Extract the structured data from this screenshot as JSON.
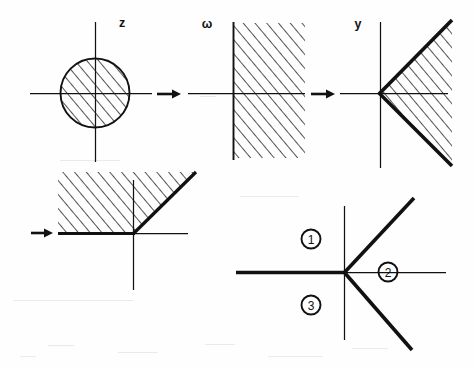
{
  "figure": {
    "background_color": "#fefefe",
    "ink_color": "#111111",
    "width": 474,
    "height": 368
  },
  "panels": [
    {
      "id": "panel-z",
      "label": "z",
      "label_pos": {
        "x": 122,
        "y": 27
      },
      "region_kind": "hatched-disk",
      "origin": {
        "x": 95,
        "y": 93
      },
      "radius": 35,
      "axes": {
        "x_from": 30,
        "x_to": 152,
        "y_from": 22,
        "y_to": 162
      },
      "hatch_angle_deg": 40,
      "hatch_spacing": 9
    },
    {
      "id": "panel-omega",
      "label": "ω",
      "label_pos": {
        "x": 207,
        "y": 27
      },
      "region_kind": "hatched-right-half-plane",
      "origin": {
        "x": 233,
        "y": 93
      },
      "axes": {
        "x_from": 188,
        "x_to": 305,
        "y_from": 22,
        "y_to": 160
      },
      "hatch_angle_deg": 40,
      "hatch_spacing": 9
    },
    {
      "id": "panel-y",
      "label": "y",
      "label_pos": {
        "x": 358,
        "y": 27
      },
      "region_kind": "hatched-wedge-right",
      "origin": {
        "x": 380,
        "y": 93
      },
      "axes": {
        "x_from": 340,
        "x_to": 448,
        "y_from": 22,
        "y_to": 168
      },
      "wedge_upper_angle_deg": -45,
      "wedge_lower_angle_deg": 45,
      "hatch_angle_deg": 40,
      "hatch_spacing": 9
    },
    {
      "id": "panel-bottom-left",
      "label": "",
      "region_kind": "hatched-above-bent-ray",
      "origin": {
        "x": 133,
        "y": 234
      },
      "axes": {
        "x_from": 60,
        "x_to": 188,
        "y_from": 180,
        "y_to": 290
      },
      "bend_angle_deg": 45,
      "hatch_angle_deg": 40,
      "hatch_spacing": 9
    },
    {
      "id": "panel-bottom-right",
      "label": "",
      "region_kind": "three-rays-sectors",
      "origin": {
        "x": 344,
        "y": 272
      },
      "axes": {
        "x_from": 236,
        "x_to": 450,
        "y_from": 206,
        "y_to": 340
      },
      "ray_upper_angle_deg": -43,
      "ray_lower_angle_deg": 43
    }
  ],
  "sector_labels": [
    {
      "text": "1",
      "x": 311,
      "y": 240
    },
    {
      "text": "2",
      "x": 388,
      "y": 272
    },
    {
      "text": "3",
      "x": 311,
      "y": 305
    }
  ],
  "flow_arrows": [
    {
      "id": "arrow-z-to-omega",
      "x": 158,
      "y": 94,
      "length": 22,
      "direction": "right"
    },
    {
      "id": "arrow-omega-to-y",
      "x": 312,
      "y": 94,
      "length": 22,
      "direction": "right"
    },
    {
      "id": "arrow-into-bottom-left",
      "x": 32,
      "y": 233,
      "length": 20,
      "direction": "right"
    }
  ]
}
